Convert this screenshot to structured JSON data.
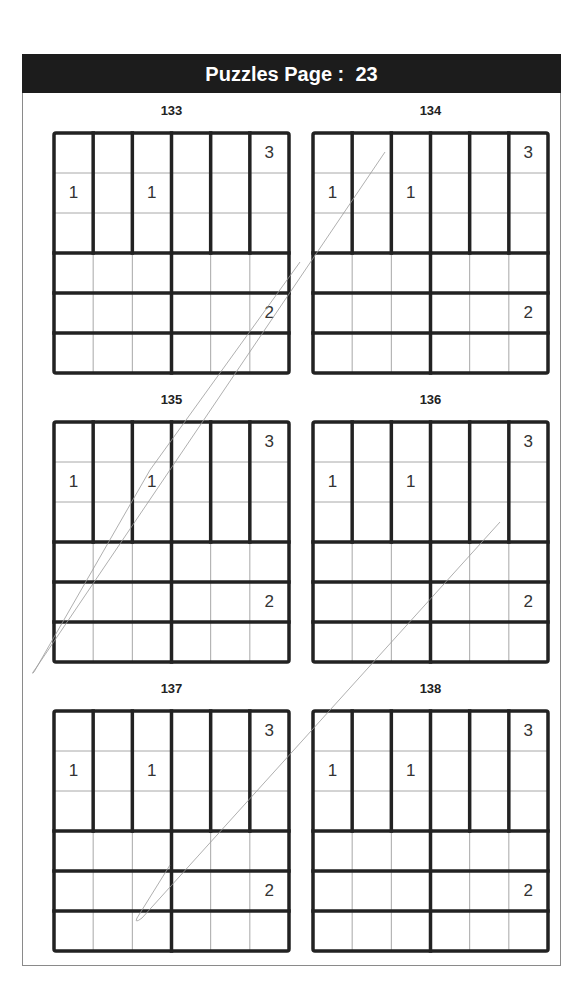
{
  "header": {
    "title_prefix": "Puzzles Page :",
    "page_number": "23"
  },
  "grid_size": 6,
  "puzzles": [
    {
      "number": "133",
      "clues": [
        {
          "row": 0,
          "col": 5,
          "value": "3"
        },
        {
          "row": 1,
          "col": 0,
          "value": "1"
        },
        {
          "row": 1,
          "col": 2,
          "value": "1"
        },
        {
          "row": 4,
          "col": 5,
          "value": "2"
        }
      ]
    },
    {
      "number": "134",
      "clues": [
        {
          "row": 0,
          "col": 5,
          "value": "3"
        },
        {
          "row": 1,
          "col": 0,
          "value": "1"
        },
        {
          "row": 1,
          "col": 2,
          "value": "1"
        },
        {
          "row": 4,
          "col": 5,
          "value": "2"
        }
      ]
    },
    {
      "number": "135",
      "clues": [
        {
          "row": 0,
          "col": 5,
          "value": "3"
        },
        {
          "row": 1,
          "col": 0,
          "value": "1"
        },
        {
          "row": 1,
          "col": 2,
          "value": "1"
        },
        {
          "row": 4,
          "col": 5,
          "value": "2"
        }
      ]
    },
    {
      "number": "136",
      "clues": [
        {
          "row": 0,
          "col": 5,
          "value": "3"
        },
        {
          "row": 1,
          "col": 0,
          "value": "1"
        },
        {
          "row": 1,
          "col": 2,
          "value": "1"
        },
        {
          "row": 4,
          "col": 5,
          "value": "2"
        }
      ]
    },
    {
      "number": "137",
      "clues": [
        {
          "row": 0,
          "col": 5,
          "value": "3"
        },
        {
          "row": 1,
          "col": 0,
          "value": "1"
        },
        {
          "row": 1,
          "col": 2,
          "value": "1"
        },
        {
          "row": 4,
          "col": 5,
          "value": "2"
        }
      ]
    },
    {
      "number": "138",
      "clues": [
        {
          "row": 0,
          "col": 5,
          "value": "3"
        },
        {
          "row": 1,
          "col": 0,
          "value": "1"
        },
        {
          "row": 1,
          "col": 2,
          "value": "1"
        },
        {
          "row": 4,
          "col": 5,
          "value": "2"
        }
      ]
    }
  ]
}
